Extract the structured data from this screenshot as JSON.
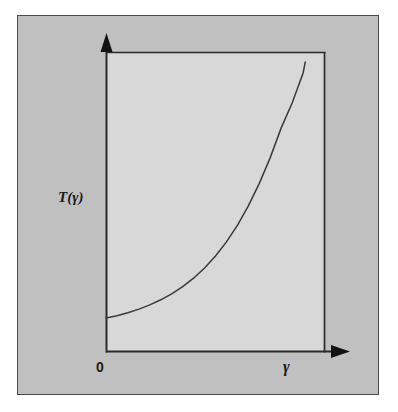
{
  "figure": {
    "background_color": "#ffffff",
    "panel_color": "#c0c0c0",
    "panel_border_color": "#4a4a4a",
    "plot_area_color": "#d8d8d8",
    "line_color": "#3a3a3a",
    "axis_color": "#2a2a2a"
  },
  "chart_data": {
    "type": "line",
    "title": "",
    "subtitle": "",
    "xlabel": "γ",
    "ylabel": "T(γ)",
    "xlim": [
      0,
      1
    ],
    "ylim": [
      0,
      1
    ],
    "grid": false,
    "legend": null,
    "axis_origin_label": "0",
    "annotations": [],
    "tick_labels": {
      "x": [
        "0"
      ],
      "y": []
    },
    "series": [
      {
        "name": "T(γ)",
        "description": "monotonically increasing convex curve rising steeply toward large γ",
        "x": [
          0.0,
          0.05,
          0.1,
          0.15,
          0.2,
          0.25,
          0.3,
          0.35,
          0.4,
          0.45,
          0.5,
          0.55,
          0.6,
          0.65,
          0.7,
          0.75,
          0.8,
          0.85,
          0.9,
          0.91
        ],
        "y": [
          0.113,
          0.121,
          0.131,
          0.143,
          0.157,
          0.174,
          0.194,
          0.218,
          0.246,
          0.28,
          0.32,
          0.367,
          0.422,
          0.487,
          0.562,
          0.648,
          0.747,
          0.83,
          0.93,
          0.967
        ]
      }
    ]
  },
  "labels": {
    "y_axis": "T(γ)",
    "x_axis": "γ",
    "origin": "0"
  },
  "icons": {
    "y_axis_arrow": "arrow-up-icon",
    "x_axis_arrow": "arrow-right-icon"
  }
}
